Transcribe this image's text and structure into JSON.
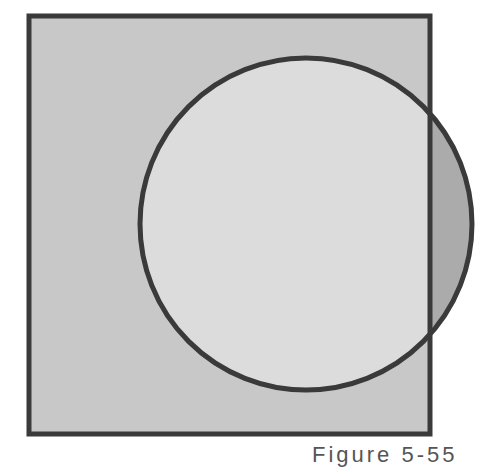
{
  "diagram": {
    "type": "venn",
    "universe": {
      "shape": "square",
      "x": 29,
      "y": 16,
      "width": 401,
      "height": 418,
      "fill": "#c8c8c8",
      "stroke": "#3a3a3a"
    },
    "set": {
      "shape": "circle",
      "cx": 306,
      "cy": 224,
      "r": 166,
      "fill_inside": "#dcdcdc",
      "fill_outside_universe": "#ababab",
      "stroke": "#3a3a3a"
    }
  },
  "caption": {
    "text": "Figure 5-55"
  }
}
